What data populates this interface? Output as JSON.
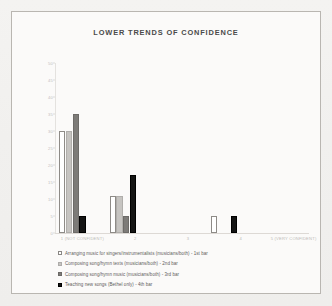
{
  "page": {
    "background_color": "#f2f1ef",
    "figure_border_color": "#b9b6b1"
  },
  "chart_data": {
    "type": "bar",
    "title": "LOWER TRENDS OF CONFIDENCE",
    "xlabel": "",
    "ylabel": "",
    "ylim": [
      0,
      50
    ],
    "yticks": [
      0,
      5,
      10,
      15,
      20,
      25,
      30,
      35,
      40,
      45,
      50
    ],
    "ytick_labels": [
      "0",
      "5",
      "10",
      "15",
      "20",
      "25",
      "30",
      "35",
      "40",
      "45",
      "50"
    ],
    "grid": false,
    "legend_position": "bottom",
    "categories": [
      "1 (NOT CONFIDENT)",
      "2",
      "3",
      "4",
      "5 (VERY CONFIDENT)"
    ],
    "series": [
      {
        "name": "Arranging music for singers/instrumentalists (musicians/both) - 1st bar",
        "color": "#ffffff",
        "values": [
          30,
          11,
          0,
          5,
          0
        ]
      },
      {
        "name": "Composing song/hymn texts (musicians/both) - 2nd bar",
        "color": "#c6c4c1",
        "values": [
          30,
          11,
          0,
          0,
          0
        ]
      },
      {
        "name": "Composing song/hymn music (musicians/both) - 3rd bar",
        "color": "#7d7b78",
        "values": [
          35,
          5,
          0,
          0,
          0
        ]
      },
      {
        "name": "Teaching new songs (Bethel only) - 4th bar",
        "color": "#141414",
        "values": [
          5,
          17,
          0,
          5,
          0
        ]
      }
    ]
  },
  "legend": {
    "entries": [
      {
        "label": "Arranging music for singers/instrumentalists (musicians/both) - 1st bar",
        "swatch": "s0"
      },
      {
        "label": "Composing song/hymn texts (musicians/both) - 2nd bar",
        "swatch": "s1"
      },
      {
        "label": "Composing song/hymn music (musicians/both) - 3rd bar",
        "swatch": "s2"
      },
      {
        "label": "Teaching new songs (Bethel only) - 4th bar",
        "swatch": "s3"
      }
    ]
  }
}
